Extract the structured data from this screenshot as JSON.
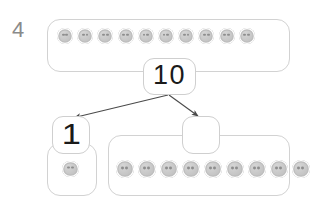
{
  "problem": {
    "number": "4"
  },
  "diagram": {
    "type": "number-bond",
    "total_card": {
      "value": "10",
      "label": "total"
    },
    "part_cards": [
      {
        "value": "1",
        "label": "part-one",
        "filled": true
      },
      {
        "value": "",
        "label": "part-two",
        "filled": false
      }
    ],
    "groups": [
      {
        "name": "top-group",
        "token_count": 10,
        "token_icon": "counter-token-icon"
      },
      {
        "name": "bottom-left-group",
        "token_count": 1,
        "token_icon": "counter-token-icon"
      },
      {
        "name": "bottom-right-group",
        "token_count": 9,
        "token_icon": "counter-token-icon"
      }
    ],
    "arrows": [
      {
        "name": "arrow-to-part-one",
        "from": "total-card",
        "to": "part-one-card",
        "direction": "down-left"
      },
      {
        "name": "arrow-to-part-two",
        "from": "total-card",
        "to": "part-two-card",
        "direction": "down-right"
      }
    ]
  },
  "colors": {
    "frame_stroke": "#d2d2d2",
    "card_stroke": "#cfcfcf",
    "token_fill": "#c6c6c6",
    "token_hole": "#8e8e8e",
    "arrow_stroke": "#4a4a4a",
    "problem_number": "#8a8a8a",
    "digit": "#1a1a1a",
    "background": "#ffffff"
  }
}
